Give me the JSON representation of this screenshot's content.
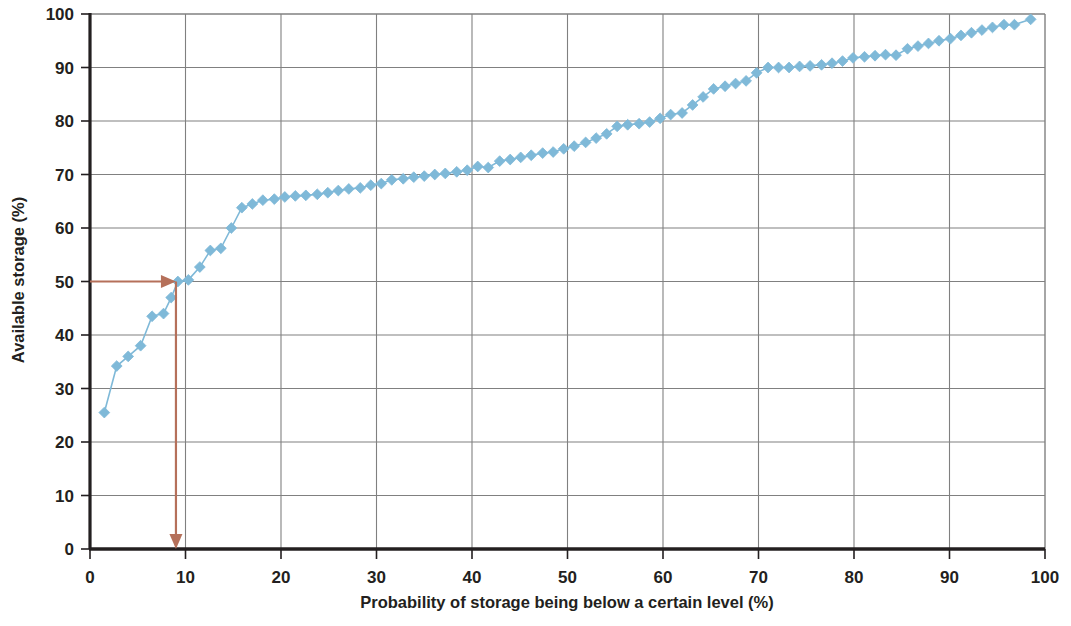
{
  "chart_data": {
    "type": "line",
    "title": "",
    "subtitle": "",
    "xlabel": "Probability of storage being below a certain level (%)",
    "ylabel": "Available storage (%)",
    "xlim": [
      0,
      100
    ],
    "ylim": [
      0,
      100
    ],
    "xticks": [
      0,
      10,
      20,
      30,
      40,
      50,
      60,
      70,
      80,
      90,
      100
    ],
    "yticks": [
      0,
      10,
      20,
      30,
      40,
      50,
      60,
      70,
      80,
      90,
      100
    ],
    "xtick_labels": [
      "0",
      "10",
      "20",
      "30",
      "40",
      "50",
      "60",
      "70",
      "80",
      "90",
      "100"
    ],
    "ytick_labels": [
      "0",
      "10",
      "20",
      "30",
      "40",
      "50",
      "60",
      "70",
      "80",
      "90",
      "100"
    ],
    "grid": true,
    "grid_color": "#808080",
    "legend": false,
    "legend_position": "none",
    "series": [
      {
        "name": "Available storage duration curve",
        "marker": "diamond",
        "marker_color": "#7fb9d8",
        "line_color": "#7fb9d8",
        "x": [
          1.5,
          2.8,
          4.0,
          5.3,
          6.5,
          7.7,
          8.5,
          9.2,
          10.3,
          11.5,
          12.6,
          13.7,
          14.8,
          15.9,
          17.0,
          18.1,
          19.3,
          20.4,
          21.5,
          22.6,
          23.8,
          24.9,
          26.0,
          27.1,
          28.3,
          29.4,
          30.5,
          31.6,
          32.8,
          33.9,
          35.0,
          36.1,
          37.2,
          38.4,
          39.5,
          40.6,
          41.7,
          42.9,
          44.0,
          45.1,
          46.2,
          47.4,
          48.5,
          49.6,
          50.7,
          51.9,
          53.0,
          54.1,
          55.2,
          56.3,
          57.5,
          58.6,
          59.7,
          60.8,
          62.0,
          63.1,
          64.2,
          65.3,
          66.5,
          67.6,
          68.7,
          69.8,
          71.0,
          72.1,
          73.2,
          74.3,
          75.4,
          76.6,
          77.7,
          78.8,
          79.9,
          81.1,
          82.2,
          83.3,
          84.4,
          85.6,
          86.7,
          87.8,
          88.9,
          90.1,
          91.2,
          92.3,
          93.4,
          94.5,
          95.7,
          96.8,
          98.5
        ],
        "y": [
          25.5,
          34.2,
          36.0,
          38.0,
          43.5,
          44.0,
          47.0,
          50.0,
          50.3,
          52.7,
          55.8,
          56.2,
          60.0,
          63.8,
          64.5,
          65.2,
          65.4,
          65.8,
          66.0,
          66.1,
          66.3,
          66.6,
          67.0,
          67.3,
          67.5,
          68.0,
          68.3,
          69.0,
          69.2,
          69.5,
          69.7,
          70.0,
          70.2,
          70.5,
          70.8,
          71.5,
          71.3,
          72.5,
          72.8,
          73.2,
          73.6,
          74.0,
          74.2,
          74.8,
          75.3,
          76.0,
          76.8,
          77.6,
          79.0,
          79.3,
          79.5,
          79.8,
          80.5,
          81.2,
          81.5,
          83.0,
          84.5,
          86.0,
          86.5,
          87.0,
          87.5,
          89.0,
          90.0,
          90.0,
          90.0,
          90.2,
          90.3,
          90.5,
          90.8,
          91.2,
          91.8,
          92.0,
          92.2,
          92.4,
          92.3,
          93.5,
          94.0,
          94.5,
          95.0,
          95.4,
          96.0,
          96.5,
          97.0,
          97.5,
          98.0,
          98.0,
          99.0
        ]
      }
    ],
    "annotations": [
      {
        "name": "median-horizontal-arrow",
        "type": "arrow",
        "color": "#b5705a",
        "from": [
          0,
          50
        ],
        "to": [
          9,
          50
        ],
        "label": ""
      },
      {
        "name": "median-vertical-arrow",
        "type": "arrow",
        "color": "#b5705a",
        "from": [
          9,
          50
        ],
        "to": [
          9,
          0
        ],
        "label": ""
      }
    ]
  }
}
